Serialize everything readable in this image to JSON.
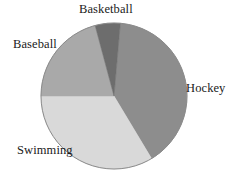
{
  "chart_data": {
    "type": "pie",
    "title": "",
    "categories": [
      "Hockey",
      "Swimming",
      "Baseball",
      "Basketball"
    ],
    "values": [
      40,
      27,
      23,
      10
    ],
    "units": "percent",
    "labels": {
      "hockey": "Hockey",
      "swimming": "Swimming",
      "baseball": "Baseball",
      "basketball": "Basketball"
    },
    "colors": {
      "hockey": "#8d8d8d",
      "swimming": "#d9d9d9",
      "baseball": "#a9a9a9",
      "basketball": "#6d6d6d",
      "outline": "#8a8a8a",
      "text": "#1a1a1a",
      "background": "#ffffff"
    },
    "slices": [
      {
        "name": "Hockey",
        "value": 40,
        "color": "#8d8d8d",
        "start_angle_deg": 5,
        "end_angle_deg": 149,
        "label_position": "right"
      },
      {
        "name": "Swimming",
        "value": 27,
        "color": "#d9d9d9",
        "start_angle_deg": 149,
        "end_angle_deg": 270,
        "label_position": "bottom-left"
      },
      {
        "name": "Baseball",
        "value": 23,
        "color": "#a9a9a9",
        "start_angle_deg": 270,
        "end_angle_deg": 345,
        "label_position": "top-left"
      },
      {
        "name": "Basketball",
        "value": 10,
        "color": "#6d6d6d",
        "start_angle_deg": 345,
        "end_angle_deg": 365,
        "label_position": "top"
      }
    ],
    "legend": "none",
    "grid": false,
    "xlabel": "",
    "ylabel": "",
    "geometry": {
      "center_x": 114,
      "center_y": 96,
      "radius": 73
    }
  }
}
